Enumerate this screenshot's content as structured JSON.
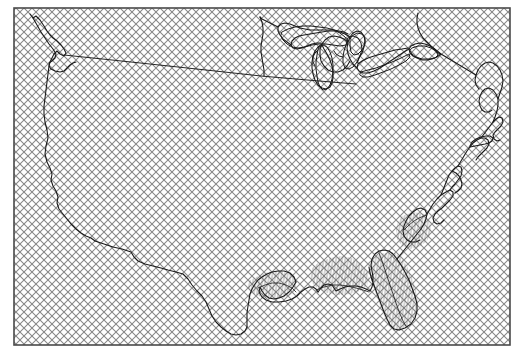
{
  "figure": {
    "kind": "map",
    "width": 523,
    "height": 358,
    "background_color": "#ffffff"
  },
  "frame": {
    "name": "map-border-frame",
    "x": 14,
    "y": 8,
    "width": 496,
    "height": 337,
    "stroke_color": "#4a4a4a",
    "stroke_width": 1.6,
    "fill": "none"
  },
  "fills": {
    "land_pattern": {
      "name": "diagonal-crosshatch",
      "line_color": "#888888",
      "line_width": 0.9,
      "spacing": 8,
      "angles": [
        45,
        -45
      ],
      "background_color": "#ffffff"
    },
    "coastal_pattern": {
      "name": "vertical-fine-hatch",
      "line_color": "#555555",
      "line_width": 0.5,
      "spacing": 3,
      "angles": [
        78
      ],
      "background_color": "#ffffff"
    }
  },
  "outlines": {
    "coast_stroke_color": "#1a1a1a",
    "coast_stroke_width": 1.1,
    "lake_stroke_color": "#1a1a1a",
    "lake_stroke_width": 1.0,
    "border_stroke_color": "#1a1a1a",
    "border_stroke_width": 1.0
  },
  "geometry": {
    "national_outline": "M 28 30 L 30 36 L 33 45 L 36 52 L 39 58 L 43 66 L 46 72 L 48 80 L 47 88 L 48 96 L 51 104 L 53 112 L 55 120 L 58 128 L 60 136 L 62 144 L 63 152 L 62 160 L 64 168 L 68 176 L 72 184 L 76 190 L 81 196 L 86 202 L 91 208 L 96 214 L 101 219 L 107 224 L 113 229 L 120 234 L 128 239 L 136 244 L 144 248 L 151 253 L 157 258 L 162 264 L 167 270 L 170 277 L 173 284 L 176 291 L 180 298 L 185 305 L 191 311 L 197 317 L 203 322 L 209 327 L 215 332 L 222 336 L 229 339 L 236 340 L 242 338 L 247 334 L 251 329 L 255 324 L 260 320 L 266 317 L 272 314 L 279 311 L 286 308 L 293 306 L 300 304 L 307 303 L 314 302 L 321 301 L 328 300 L 335 299 L 342 298 L 348 296 L 353 292 L 357 287 L 360 281 L 363 275 L 366 269 L 369 262 L 373 256 L 378 250 L 383 244 L 388 238 L 393 232 L 397 225 L 401 218 L 404 211 L 407 204 L 410 197 L 414 190 L 418 183 L 422 176 L 426 169 L 430 162 L 434 155 L 438 148 L 442 141 L 446 134 L 450 127 L 454 120 L 458 113 L 462 106 L 466 99 L 470 92 L 474 85 L 478 78 L 482 71 L 486 64 L 490 57 L 493 50 L 495 43 L 496 36 L 495 29 L 492 23 L 487 19 L 481 17 L 474 17 L 467 19 L 460 22 L 453 25 L 446 27 L 439 28 L 432 28 L 425 28 L 418 28 L 411 28 L 404 28 L 397 28 L 390 28 L 383 28 L 376 28 L 369 28 L 362 28 L 355 28 L 348 28 L 341 28 L 334 28 L 327 28 L 320 28 L 313 28 L 306 28 L 299 28 L 292 28 L 285 28 L 278 28 L 271 28 L 264 28 L 257 28 L 250 28 L 243 28 L 236 29 L 229 29 L 222 30 L 215 30 L 208 31 L 201 31 L 194 32 L 187 32 L 180 33 L 173 33 L 166 34 L 159 34 L 152 35 L 145 35 L 138 36 L 131 36 L 124 37 L 117 37 L 110 38 L 103 38 L 96 39 L 89 39 L 82 40 L 75 40 L 68 41 L 61 41 L 54 42 L 47 42 L 40 43 L 33 43 Z",
    "notes": "Outline paths are rendered directly in the SVG template; this key documents that the map is a single-polygon national boundary with inset lakes and coastal shading regions."
  },
  "features": [
    {
      "name": "pacific-northwest-coast",
      "label": "Pacific Northwest / Puget Sound"
    },
    {
      "name": "california-coast",
      "label": "California Coast"
    },
    {
      "name": "mexico-border",
      "label": "US-Mexico Border"
    },
    {
      "name": "gulf-coast",
      "label": "Gulf Coast"
    },
    {
      "name": "florida-peninsula",
      "label": "Florida Peninsula"
    },
    {
      "name": "atlantic-coast",
      "label": "Atlantic Coast"
    },
    {
      "name": "chesapeake-bay",
      "label": "Chesapeake Bay"
    },
    {
      "name": "new-england-coast",
      "label": "New England / Maine Coast"
    },
    {
      "name": "canada-border",
      "label": "US-Canada Border (49th Parallel)"
    },
    {
      "name": "lake-superior",
      "label": "Lake Superior"
    },
    {
      "name": "lake-michigan",
      "label": "Lake Michigan"
    },
    {
      "name": "lake-huron",
      "label": "Lake Huron"
    },
    {
      "name": "lake-erie",
      "label": "Lake Erie"
    },
    {
      "name": "lake-ontario",
      "label": "Lake Ontario"
    }
  ]
}
